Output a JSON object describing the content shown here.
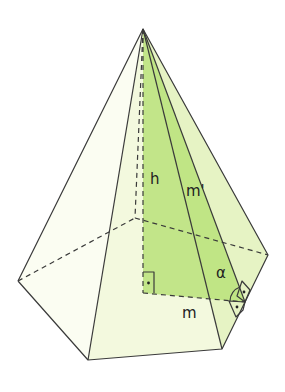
{
  "diagram": {
    "colors": {
      "edge": "#3a3a3a",
      "face_light": "#f3f9de",
      "face_right": "#e6f3c4",
      "triangle_green": "#b8e27a",
      "background": "#ffffff"
    },
    "labels": {
      "height": "h",
      "slant_height": "m'",
      "apothem": "m",
      "angle": "α"
    },
    "points": {
      "apex": [
        143,
        29
      ],
      "left": [
        18,
        281
      ],
      "front_left": [
        88,
        360
      ],
      "front_right": [
        222,
        349
      ],
      "right": [
        268,
        255
      ],
      "back": [
        135,
        218
      ],
      "base_center": [
        143,
        293
      ],
      "apothem_foot": [
        245,
        302
      ]
    },
    "marks": [
      "right-angle at base center",
      "right-angle at apothem foot (x2)",
      "angle α between m and m'"
    ]
  }
}
